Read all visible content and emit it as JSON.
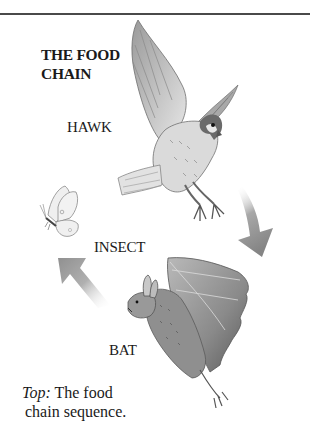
{
  "title": {
    "line1": "THE FOOD",
    "line2": "CHAIN"
  },
  "labels": {
    "hawk": "HAWK",
    "insect": "INSECT",
    "bat": "BAT"
  },
  "caption": {
    "prefix": "Top:",
    "line1_rest": " The food",
    "line2": "chain sequence."
  },
  "illustrations": [
    "hawk-illustration",
    "butterfly-illustration",
    "bat-illustration"
  ],
  "arrows": [
    {
      "name": "arrow-hawk-to-bat",
      "direction": "down-left",
      "color": "#8c8c8c"
    },
    {
      "name": "arrow-bat-to-insect",
      "direction": "up-left",
      "color": "#9a9a9a"
    }
  ],
  "colors": {
    "rule": "#4a4a4a",
    "text": "#1a1a1a",
    "background": "#ffffff"
  }
}
